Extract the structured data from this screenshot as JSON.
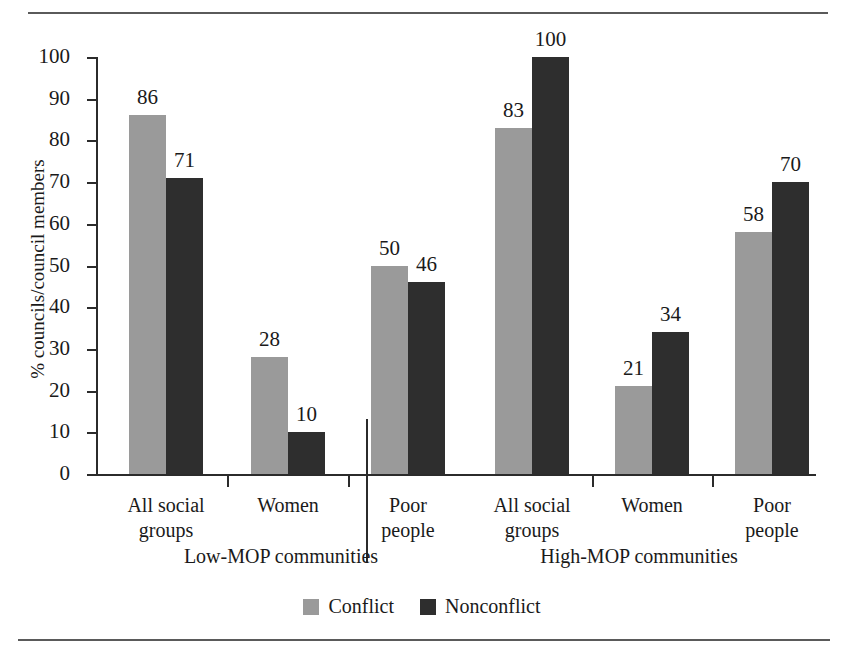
{
  "chart_data": {
    "type": "bar",
    "title": "",
    "xlabel": "",
    "ylabel": "% councils/council members",
    "ylim": [
      0,
      100
    ],
    "yticks": [
      0,
      10,
      20,
      30,
      40,
      50,
      60,
      70,
      80,
      90,
      100
    ],
    "grid": false,
    "legend_position": "bottom-center",
    "categories": [
      "All social groups",
      "Women",
      "Poor people",
      "All social groups",
      "Women",
      "Poor people"
    ],
    "panels": [
      {
        "title": "Low-MOP communities",
        "categories": [
          "All social groups",
          "Women",
          "Poor people"
        ]
      },
      {
        "title": "High-MOP communities",
        "categories": [
          "All social groups",
          "Women",
          "Poor people"
        ]
      }
    ],
    "series": [
      {
        "name": "Conflict",
        "color": "#9a9a9a",
        "values": [
          86,
          28,
          50,
          83,
          21,
          58
        ]
      },
      {
        "name": "Nonconflict",
        "color": "#2e2e2e",
        "values": [
          71,
          10,
          46,
          100,
          34,
          70
        ]
      }
    ],
    "groups": [
      {
        "panel": "Low-MOP communities",
        "category": "All social groups",
        "category_line1": "All social",
        "category_line2": "groups",
        "conflict": 86,
        "nonconflict": 71
      },
      {
        "panel": "Low-MOP communities",
        "category": "Women",
        "category_line1": "Women",
        "category_line2": "",
        "conflict": 28,
        "nonconflict": 10
      },
      {
        "panel": "Low-MOP communities",
        "category": "Poor people",
        "category_line1": "Poor",
        "category_line2": "people",
        "conflict": 50,
        "nonconflict": 46
      },
      {
        "panel": "High-MOP communities",
        "category": "All social groups",
        "category_line1": "All social",
        "category_line2": "groups",
        "conflict": 83,
        "nonconflict": 100
      },
      {
        "panel": "High-MOP communities",
        "category": "Women",
        "category_line1": "Women",
        "category_line2": "",
        "conflict": 21,
        "nonconflict": 34
      },
      {
        "panel": "High-MOP communities",
        "category": "Poor people",
        "category_line1": "Poor",
        "category_line2": "people",
        "conflict": 58,
        "nonconflict": 70
      }
    ]
  },
  "axis": {
    "ylabel": "% councils/council members",
    "ytick_labels": [
      "100",
      "90",
      "80",
      "70",
      "60",
      "50",
      "40",
      "30",
      "20",
      "10",
      "0"
    ]
  },
  "legend": {
    "items": [
      {
        "label": "Conflict",
        "swatch": "conflict-swatch",
        "color": "#9a9a9a"
      },
      {
        "label": "Nonconflict",
        "swatch": "nonconflict-swatch",
        "color": "#2e2e2e"
      }
    ]
  },
  "panel_titles": {
    "left": "Low-MOP communities",
    "right": "High-MOP communities"
  }
}
